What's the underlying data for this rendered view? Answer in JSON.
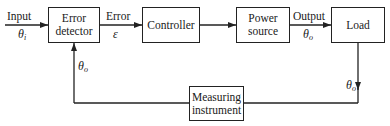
{
  "diagram": {
    "type": "closed-loop control system block diagram",
    "blocks": [
      {
        "id": "error_detector",
        "line1": "Error",
        "line2": "detector"
      },
      {
        "id": "controller",
        "line1": "Controller"
      },
      {
        "id": "power_source",
        "line1": "Power",
        "line2": "source"
      },
      {
        "id": "load",
        "line1": "Load"
      },
      {
        "id": "measuring_instrument",
        "line1": "Measuring",
        "line2": "instrument"
      }
    ],
    "signals": {
      "input": {
        "label": "Input",
        "symbol": "θ",
        "sub": "i"
      },
      "error": {
        "label": "Error",
        "symbol": "ε"
      },
      "output": {
        "label": "Output",
        "symbol": "θ",
        "sub": "o"
      },
      "feedback_right": {
        "symbol": "θ",
        "sub": "o"
      },
      "feedback_left": {
        "symbol": "θ",
        "sub": "o"
      }
    },
    "connections": [
      {
        "from": "input",
        "to": "error_detector"
      },
      {
        "from": "error_detector",
        "to": "controller",
        "label": "Error ε"
      },
      {
        "from": "controller",
        "to": "power_source"
      },
      {
        "from": "power_source",
        "to": "load",
        "label": "Output θo"
      },
      {
        "from": "load",
        "to": "measuring_instrument",
        "label": "θo"
      },
      {
        "from": "measuring_instrument",
        "to": "error_detector",
        "label": "θo"
      }
    ],
    "colors": {
      "line": "#222222",
      "background": "#ffffff"
    }
  }
}
